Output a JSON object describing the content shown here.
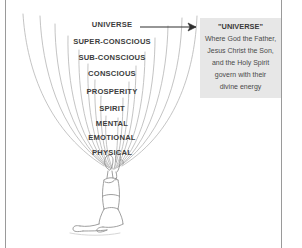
{
  "diagram": {
    "title_hidden": "",
    "levels": [
      {
        "label": "UNIVERSE",
        "top": 21,
        "size": 7.6
      },
      {
        "label": "SUPER-CONSCIOUS",
        "top": 38,
        "size": 7.6
      },
      {
        "label": "SUB-CONSCIOUS",
        "top": 54,
        "size": 7.6
      },
      {
        "label": "CONSCIOUS",
        "top": 70,
        "size": 7.6
      },
      {
        "label": "PROSPERITY",
        "top": 88,
        "size": 7.6
      },
      {
        "label": "SPIRIT",
        "top": 105,
        "size": 7.6
      },
      {
        "label": "MENTAL",
        "top": 120,
        "size": 7.6
      },
      {
        "label": "EMOTIONAL",
        "top": 134,
        "size": 7.6
      },
      {
        "label": "PHYSICAL",
        "top": 149,
        "size": 7.6
      }
    ],
    "figure": {
      "name": "kneeling-praying-person",
      "description": "kneeling figure with hands raised in prayer"
    },
    "waves": {
      "name": "concentric-energy-arcs",
      "count": 9
    },
    "arrow": {
      "name": "pointer-arrow",
      "from_x": 140,
      "to_x": 200,
      "y": 27
    }
  },
  "callout": {
    "title": "\"UNIVERSE\"",
    "lines": [
      "Where God the Father,",
      "Jesus Christ the Son,",
      "and the Holy Spirit",
      "govern with their",
      "divine energy"
    ],
    "background": "#e7e7e7"
  },
  "colors": {
    "ink": "#3d3d3d",
    "line": "#9a9a9a",
    "paper": "#ffffff",
    "sketch": "#b9b9b9"
  }
}
